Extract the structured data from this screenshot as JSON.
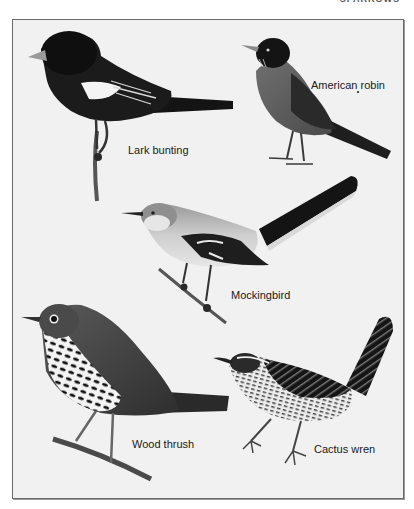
{
  "page": {
    "running_head": "SPARROWS"
  },
  "plate": {
    "background": "#f1f1f1",
    "border_color": "#6a6a6a",
    "birds": [
      {
        "id": "lark-bunting",
        "label": "Lark bunting"
      },
      {
        "id": "american-robin",
        "label": "American robin"
      },
      {
        "id": "mockingbird",
        "label": "Mockingbird"
      },
      {
        "id": "wood-thrush",
        "label": "Wood thrush"
      },
      {
        "id": "cactus-wren",
        "label": "Cactus wren"
      }
    ]
  }
}
